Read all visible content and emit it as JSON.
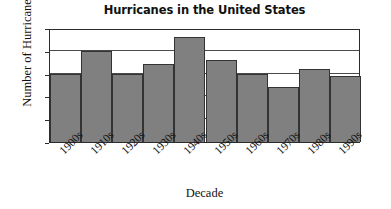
{
  "chart_data": {
    "type": "bar",
    "title": "Hurricanes in the United States",
    "xlabel": "Decade",
    "ylabel": "Number of Hurricanes",
    "categories": [
      "1900s",
      "1910s",
      "1920s",
      "1930s",
      "1940s",
      "1950s",
      "1960s",
      "1970s",
      "1980s",
      "1990s"
    ],
    "values": [
      15,
      20,
      15,
      17,
      23,
      18,
      15,
      12,
      16,
      14.5
    ],
    "ylim": [
      0,
      25
    ],
    "yticks": [
      0,
      5,
      10,
      15,
      20,
      25
    ],
    "grid": true,
    "grid_axis": "y",
    "legend": "none",
    "bar_color": "#808080",
    "bar_edge_color": "#333333",
    "axis_color": "#2b2b2b",
    "background_color": "#ffffff",
    "xtick_rotation": -45
  }
}
